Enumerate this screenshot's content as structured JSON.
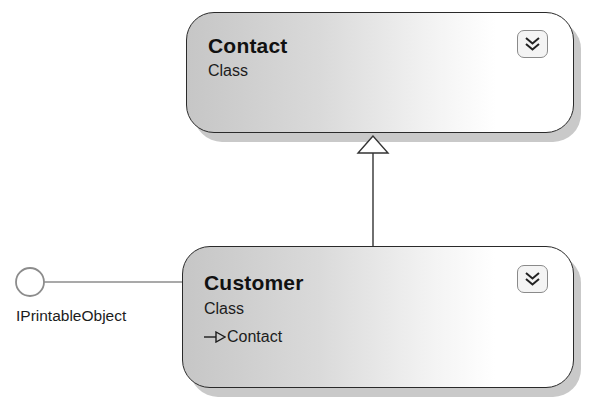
{
  "diagram": {
    "classes": [
      {
        "id": "contact",
        "name": "Contact",
        "stereotype": "Class",
        "base": null,
        "toggle_icon": "double-chevron-down-icon"
      },
      {
        "id": "customer",
        "name": "Customer",
        "stereotype": "Class",
        "base": "Contact",
        "base_prefix_icon": "inheritance-arrow-icon",
        "toggle_icon": "double-chevron-down-icon"
      }
    ],
    "interfaces": [
      {
        "name": "IPrintableObject",
        "implemented_by": "Customer",
        "icon": "lollipop-interface-icon"
      }
    ],
    "relationships": [
      {
        "type": "inheritance",
        "from": "Customer",
        "to": "Contact"
      },
      {
        "type": "implements",
        "from": "Customer",
        "to": "IPrintableObject"
      }
    ],
    "colors": {
      "border": "#2a2a2a",
      "shadow": "#c9c9c9",
      "gradient_start": "#c6c6c6",
      "gradient_end": "#ffffff",
      "connector": "#777777"
    }
  }
}
